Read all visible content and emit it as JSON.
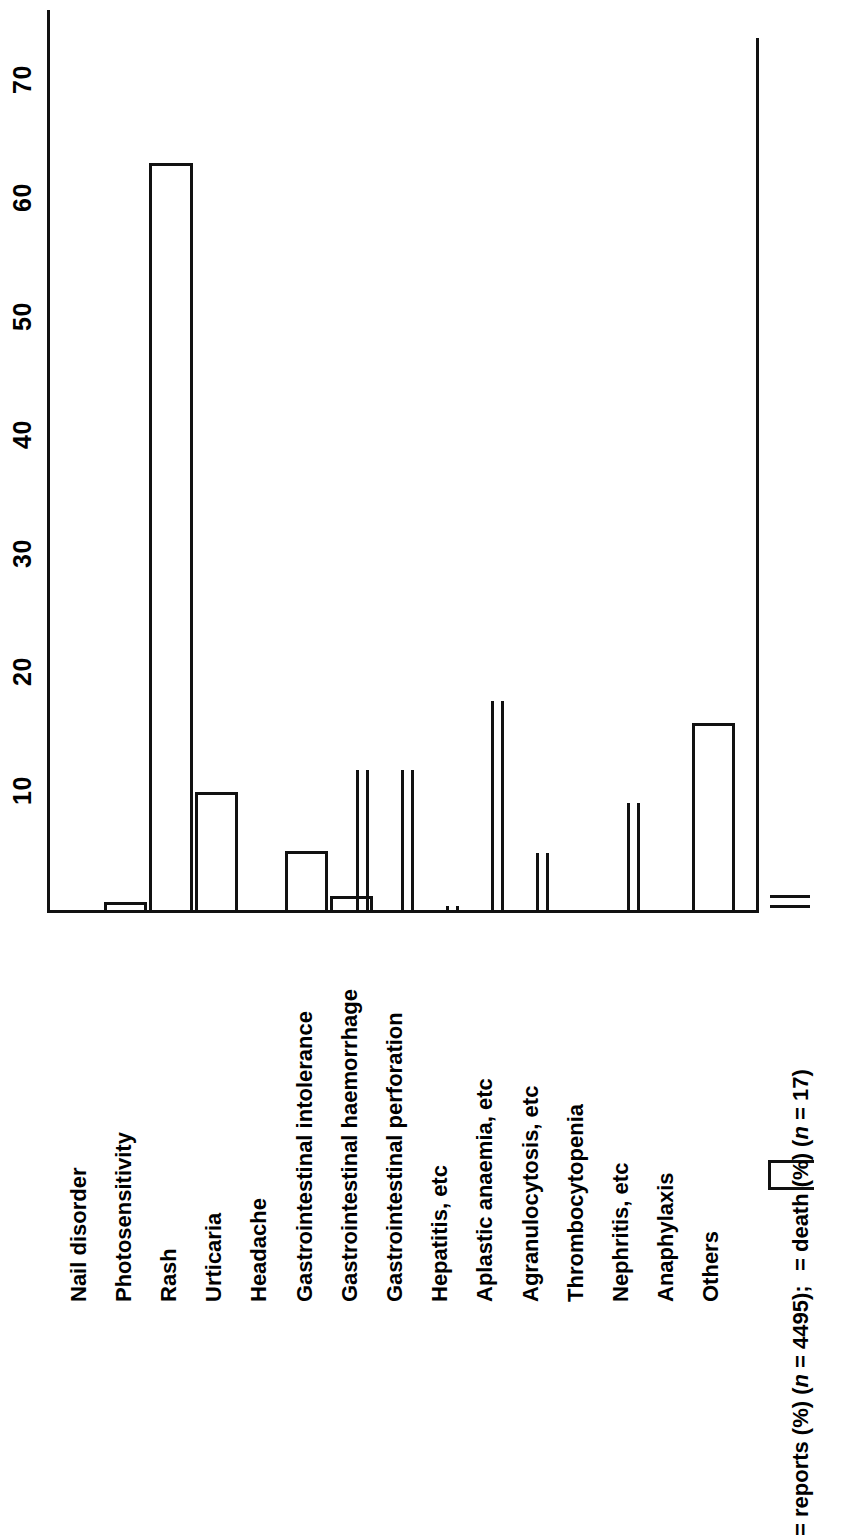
{
  "chart_data": {
    "type": "bar",
    "title": "",
    "subtitle": "",
    "orientation": "horizontal-rotated",
    "xlabel": "",
    "ylabel": "",
    "ylim": [
      0,
      75
    ],
    "grid": false,
    "legend_position": "bottom-right",
    "axis_ticks": [
      "10",
      "20",
      "30",
      "40",
      "50",
      "60",
      "70"
    ],
    "axis_tick_values": [
      10,
      20,
      30,
      40,
      50,
      60,
      70
    ],
    "categories": [
      "Nail disorder",
      "Photosensitivity",
      "Rash",
      "Urticaria",
      "Headache",
      "Gastrointestinal intolerance",
      "Gastrointestinal haemorrhage",
      "Gastrointestinal perforation",
      "Hepatitis, etc",
      "Aplastic anaemia, etc",
      "Agranulocytosis, etc",
      "Thrombocytopenia",
      "Nephritis, etc",
      "Anaphylaxis",
      "Others"
    ],
    "series": [
      {
        "name": "reports (%)",
        "n": 4495,
        "style": "open-outline-bar",
        "values": [
          0,
          0.7,
          63,
          10,
          0,
          5,
          1.2,
          0,
          0,
          0,
          0,
          0,
          0,
          0,
          15.8
        ]
      },
      {
        "name": "death (%)",
        "n": 17,
        "style": "double-line-bar",
        "values": [
          0,
          0,
          0,
          0,
          0,
          0,
          11.8,
          11.8,
          0.3,
          17.6,
          4.8,
          0,
          9,
          0,
          0
        ]
      }
    ],
    "legend": [
      {
        "swatch": "open-outline-bar",
        "label": "= reports (%) (n = 4495);",
        "label_plain": "= reports (%) (n = 4495);",
        "n_label": "4495"
      },
      {
        "swatch": "double-line-bar",
        "label": "= death (%) (n = 17)",
        "label_plain": "= death (%) (n = 17)",
        "n_label": "17"
      }
    ]
  },
  "legend": {
    "reports_prefix": "= reports (%) (",
    "reports_italic_n": "n",
    "reports_suffix": " = 4495);",
    "death_prefix": "= death (%) (",
    "death_italic_n": "n",
    "death_suffix": " = 17)"
  }
}
